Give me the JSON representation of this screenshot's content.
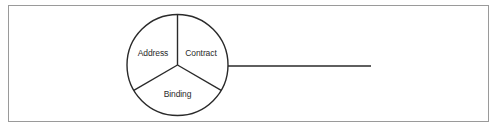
{
  "diagram": {
    "type": "endpoint-abc",
    "circle": {
      "cx": 177.5,
      "cy": 65,
      "r": 50.5,
      "stroke": "#2a2a2a"
    },
    "segments": [
      {
        "label": "Address",
        "x": 153,
        "y": 56
      },
      {
        "label": "Contract",
        "x": 201,
        "y": 56
      },
      {
        "label": "Binding",
        "x": 177.5,
        "y": 97
      }
    ],
    "connector": {
      "x1": 228,
      "y1": 66,
      "x2": 371,
      "y2": 66
    },
    "frame_color": "#9a9a9a"
  }
}
